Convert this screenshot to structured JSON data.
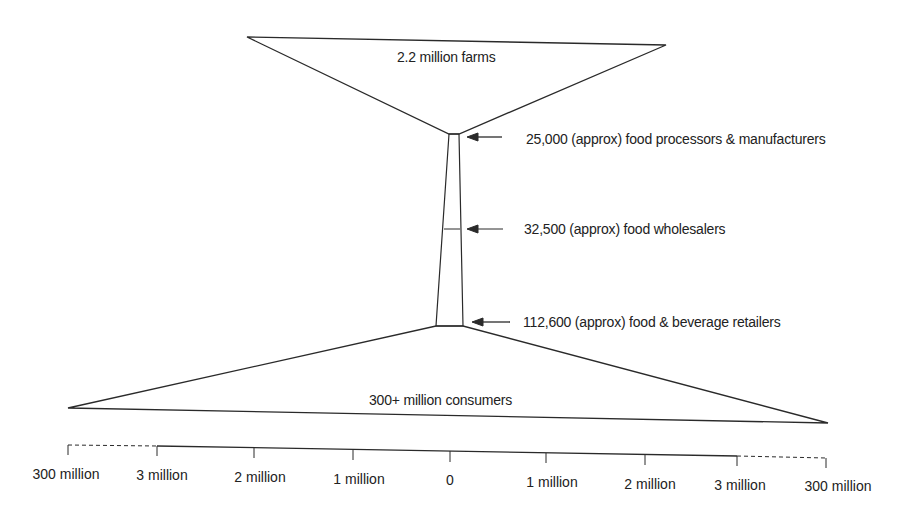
{
  "diagram": {
    "type": "funnel-hourglass",
    "title": "",
    "stages": [
      {
        "id": "farms",
        "label": "2.2 million farms",
        "count": 2200000
      },
      {
        "id": "processors",
        "label": "25,000 (approx) food processors & manufacturers",
        "count": 25000
      },
      {
        "id": "wholesalers",
        "label": "32,500 (approx) food wholesalers",
        "count": 32500
      },
      {
        "id": "retailers",
        "label": "112,600 (approx) food & beverage retailers",
        "count": 112600
      },
      {
        "id": "consumers",
        "label": "300+ million consumers",
        "count": 300000000
      }
    ],
    "axis": {
      "ticks": [
        "300 million",
        "3 million",
        "2 million",
        "1 million",
        "0",
        "1 million",
        "2 million",
        "3 million",
        "300 million"
      ],
      "broken_segments": [
        "300 million to 3 million (left, dashed)",
        "3 million to 300 million (right, dashed)"
      ]
    },
    "colors": {
      "line": "#2a2a2a",
      "background": "#ffffff"
    }
  }
}
